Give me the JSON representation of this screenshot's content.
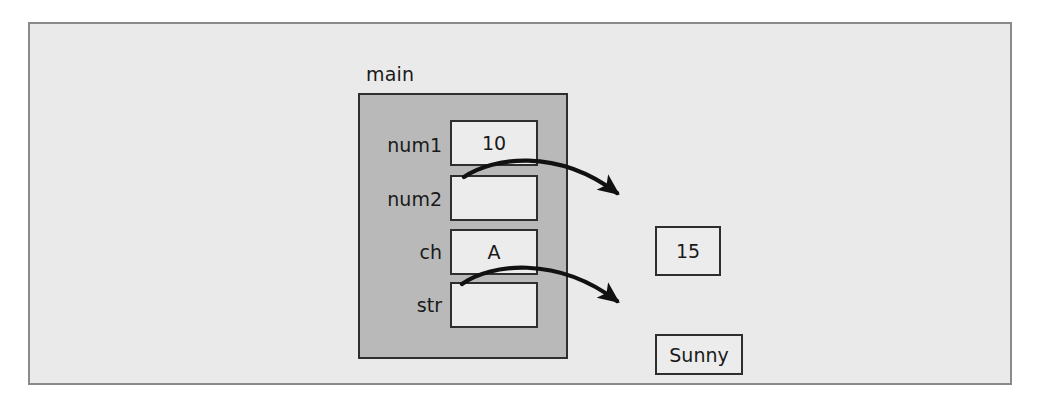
{
  "figure": {
    "background_color": "#eaeaea",
    "frame_color": "#8a8a8a"
  },
  "scope": {
    "name": "main",
    "fill_color": "#b9b9b9",
    "border_color": "#2e2e2e",
    "variables": [
      {
        "label": "num1",
        "value": "10",
        "is_reference": false
      },
      {
        "label": "num2",
        "value": "",
        "is_reference": true
      },
      {
        "label": "ch",
        "value": "A",
        "is_reference": false
      },
      {
        "label": "str",
        "value": "",
        "is_reference": true
      }
    ]
  },
  "heap": {
    "cells": [
      {
        "id": "heap-int",
        "value": "15"
      },
      {
        "id": "heap-str",
        "value": "Sunny"
      }
    ]
  },
  "arrows": [
    {
      "from": "num2",
      "to": "heap-int"
    },
    {
      "from": "str",
      "to": "heap-str"
    }
  ]
}
